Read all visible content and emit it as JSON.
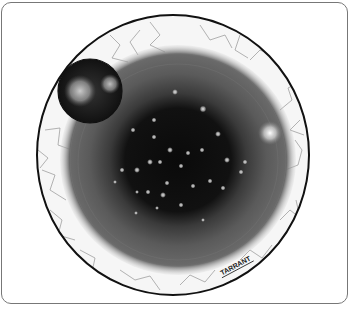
{
  "figure": {
    "signature": "TARRANT",
    "elements": {
      "sclera": {
        "label": "sclera with blood vessels",
        "color": "#f4f4f4",
        "vessel_color": "#9a9a9a"
      },
      "outer_ring": {
        "label": "outer circular border",
        "color": "#111111"
      },
      "iris": {
        "label": "iris",
        "color": "#5e5e5e"
      },
      "pupil": {
        "label": "dark pupil region with scattered light spots",
        "color": "#0e0e0e",
        "spot_color": "#d8d8d8"
      },
      "inset": {
        "label": "magnified inset circle",
        "color": "#222222",
        "speckle_color": "#cfcfcf"
      },
      "highlight": {
        "label": "bright reflection spot",
        "color": "#eeeeee"
      }
    },
    "colors": {
      "background": "#ffffff",
      "frame_border": "#777777"
    }
  }
}
